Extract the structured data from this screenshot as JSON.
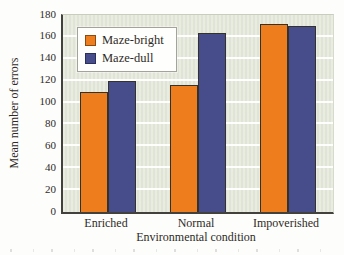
{
  "figure": {
    "x_axis_title": "Environmental condition",
    "y_axis_title": "Mean number of errors"
  },
  "chart_data": {
    "type": "bar",
    "categories": [
      "Enriched",
      "Normal",
      "Impoverished"
    ],
    "series": [
      {
        "name": "Maze-bright",
        "color": "#ee7d1e",
        "border_color": "#8a4a12",
        "values": [
          110,
          116,
          172
        ]
      },
      {
        "name": "Maze-dull",
        "color": "#474c8b",
        "border_color": "#2b2f5e",
        "values": [
          120,
          164,
          170
        ]
      }
    ],
    "title": "",
    "xlabel": "Environmental condition",
    "ylabel": "Mean number of errors",
    "ylim": [
      0,
      180
    ],
    "ytick_step": 20,
    "grid": "horizontal",
    "gridline_color": "#ffffff",
    "plot_background": "#e4e8da",
    "legend_position": "upper-left-inside"
  }
}
